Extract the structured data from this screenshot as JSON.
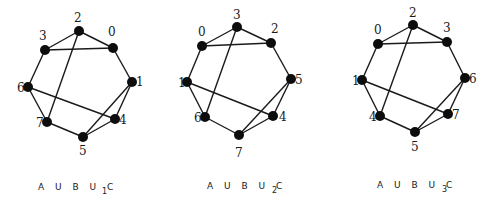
{
  "graphs": [
    {
      "caption": "A U B U C",
      "subscript": "1",
      "nodes": {
        "2": [
          79,
          31
        ],
        "0": [
          113,
          48
        ],
        "3": [
          45,
          50
        ],
        "1": [
          132,
          82
        ],
        "6": [
          28,
          87
        ],
        "4": [
          115,
          119
        ],
        "7": [
          47,
          122
        ],
        "5": [
          83,
          137
        ]
      },
      "edges": [
        [
          "2",
          "0"
        ],
        [
          "2",
          "3"
        ],
        [
          "3",
          "0"
        ],
        [
          "3",
          "6"
        ],
        [
          "0",
          "1"
        ],
        [
          "1",
          "4"
        ],
        [
          "1",
          "5"
        ],
        [
          "6",
          "7"
        ],
        [
          "6",
          "4"
        ],
        [
          "2",
          "7"
        ],
        [
          "7",
          "5"
        ],
        [
          "5",
          "4"
        ]
      ]
    },
    {
      "caption": "A U B U C",
      "subscript": "2",
      "nodes": {
        "3": [
          237,
          27
        ],
        "0": [
          202,
          46
        ],
        "2": [
          271,
          43
        ],
        "1": [
          187,
          82
        ],
        "5": [
          291,
          79
        ],
        "6": [
          205,
          117
        ],
        "4": [
          273,
          116
        ],
        "7": [
          239,
          135
        ]
      },
      "edges": [
        [
          "3",
          "0"
        ],
        [
          "3",
          "2"
        ],
        [
          "0",
          "2"
        ],
        [
          "0",
          "1"
        ],
        [
          "2",
          "5"
        ],
        [
          "5",
          "4"
        ],
        [
          "5",
          "7"
        ],
        [
          "1",
          "6"
        ],
        [
          "1",
          "4"
        ],
        [
          "3",
          "6"
        ],
        [
          "6",
          "7"
        ],
        [
          "7",
          "4"
        ]
      ]
    },
    {
      "caption": "A U B U C",
      "subscript": "3",
      "nodes": {
        "2": [
          413,
          25
        ],
        "0": [
          378,
          44
        ],
        "3": [
          447,
          42
        ],
        "1": [
          362,
          80
        ],
        "6": [
          465,
          78
        ],
        "4": [
          380,
          116
        ],
        "7": [
          448,
          114
        ],
        "5": [
          415,
          132
        ]
      },
      "edges": [
        [
          "2",
          "0"
        ],
        [
          "2",
          "3"
        ],
        [
          "0",
          "3"
        ],
        [
          "0",
          "1"
        ],
        [
          "3",
          "6"
        ],
        [
          "6",
          "7"
        ],
        [
          "6",
          "5"
        ],
        [
          "1",
          "4"
        ],
        [
          "1",
          "7"
        ],
        [
          "2",
          "4"
        ],
        [
          "4",
          "5"
        ],
        [
          "5",
          "7"
        ]
      ]
    }
  ],
  "labels": [
    {
      "text": "2",
      "x": 74,
      "y": 22
    },
    {
      "text": "0",
      "x": 108,
      "y": 36
    },
    {
      "text": "3",
      "x": 39,
      "y": 40
    },
    {
      "text": "1",
      "x": 136,
      "y": 86
    },
    {
      "text": "6",
      "x": 17,
      "y": 92
    },
    {
      "text": "4",
      "x": 119,
      "y": 124
    },
    {
      "text": "7",
      "x": 36,
      "y": 127
    },
    {
      "text": "5",
      "x": 79,
      "y": 155
    },
    {
      "text": "3",
      "x": 233,
      "y": 19
    },
    {
      "text": "0",
      "x": 198,
      "y": 36
    },
    {
      "text": "2",
      "x": 271,
      "y": 33
    },
    {
      "text": "1",
      "x": 178,
      "y": 87
    },
    {
      "text": "5",
      "x": 295,
      "y": 84
    },
    {
      "text": "6",
      "x": 194,
      "y": 122
    },
    {
      "text": "4",
      "x": 279,
      "y": 121
    },
    {
      "text": "7",
      "x": 235,
      "y": 157
    },
    {
      "text": "2",
      "x": 409,
      "y": 17
    },
    {
      "text": "0",
      "x": 374,
      "y": 34
    },
    {
      "text": "3",
      "x": 443,
      "y": 32
    },
    {
      "text": "1",
      "x": 352,
      "y": 85
    },
    {
      "text": "6",
      "x": 469,
      "y": 83
    },
    {
      "text": "4",
      "x": 369,
      "y": 121
    },
    {
      "text": "7",
      "x": 452,
      "y": 119
    },
    {
      "text": "5",
      "x": 411,
      "y": 151
    }
  ]
}
